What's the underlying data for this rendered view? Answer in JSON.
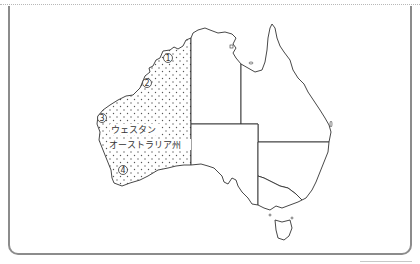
{
  "map": {
    "subject": "Australia",
    "highlighted_region": {
      "label_line1": "ウェスタン",
      "label_line2": "オーストラリア州",
      "pattern": "dotted"
    },
    "markers": [
      {
        "id": "1",
        "glyph": "①"
      },
      {
        "id": "2",
        "glyph": "②"
      },
      {
        "id": "3",
        "glyph": "③"
      },
      {
        "id": "4",
        "glyph": "④"
      }
    ],
    "colors": {
      "outline": "#333333",
      "frame": "#8c8c8c",
      "dots": "#555555",
      "background": "#ffffff"
    }
  }
}
